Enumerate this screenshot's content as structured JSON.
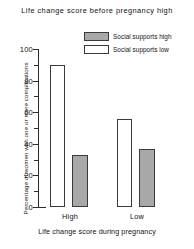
{
  "chart_data": {
    "type": "bar",
    "title": "Life change score before pregnancy high",
    "xlabel": "Life change score during pregnancy",
    "ylabel": "Percentage of women with one or more complications",
    "categories": [
      "High",
      "Low"
    ],
    "series": [
      {
        "name": "Social supports low",
        "values": [
          90,
          56
        ],
        "color": "#ffffff"
      },
      {
        "name": "Social supports high",
        "values": [
          33,
          37
        ],
        "color": "#a8a8a8"
      }
    ],
    "legend_order": [
      "Social supports high",
      "Social supports low"
    ],
    "legend_position": "top-right-inside",
    "ylim": [
      0,
      100
    ],
    "yticks": [
      0,
      20,
      40,
      60,
      80,
      100
    ],
    "ytick_labels": [
      "0",
      "20",
      "40",
      "60",
      "80",
      "100"
    ],
    "yminor_ticks": [
      10,
      30,
      50,
      70,
      90
    ],
    "grid": false
  },
  "legend": {
    "items": [
      {
        "label": "Social supports high",
        "swatch": "high"
      },
      {
        "label": "Social supports low",
        "swatch": "low"
      }
    ]
  },
  "yticks": {
    "t0": "0",
    "t20": "20",
    "t40": "40",
    "t60": "60",
    "t80": "80",
    "t100": "100"
  },
  "groups": {
    "g0": "High",
    "g1": "Low"
  }
}
